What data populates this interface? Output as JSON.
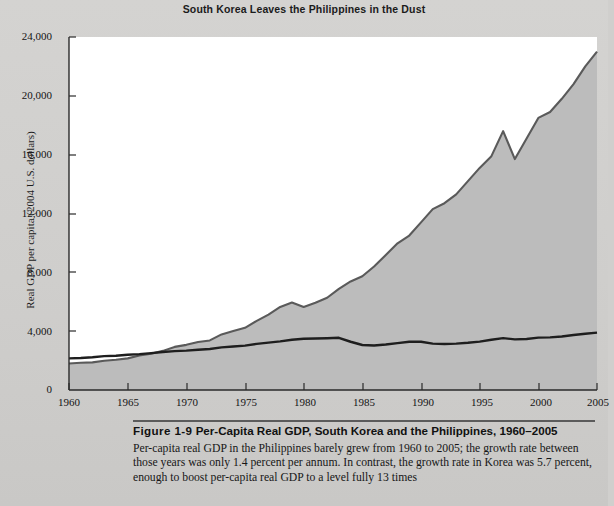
{
  "chart_data": {
    "type": "area",
    "title": "South Korea Leaves the Philippines in the Dust",
    "xlabel": "",
    "ylabel": "Real GDP per capita (2004 U.S. dollars)",
    "xlim": [
      1960,
      2005
    ],
    "ylim": [
      0,
      24000
    ],
    "grid": false,
    "legend_position": "inline-annotations",
    "x_ticks": [
      "1960",
      "1965",
      "1970",
      "1975",
      "1980",
      "1985",
      "1990",
      "1995",
      "2000",
      "2005"
    ],
    "y_ticks": [
      "0",
      "4,000",
      "8,000",
      "12,000",
      "16,000",
      "20,000",
      "24,000"
    ],
    "annotations": [
      {
        "text": "South Korea",
        "x": 1989,
        "y": 13900
      },
      {
        "text": "Philippines",
        "x": 1992,
        "y": 5200
      }
    ],
    "x": [
      1960,
      1961,
      1962,
      1963,
      1964,
      1965,
      1966,
      1967,
      1968,
      1969,
      1970,
      1971,
      1972,
      1973,
      1974,
      1975,
      1976,
      1977,
      1978,
      1979,
      1980,
      1981,
      1982,
      1983,
      1984,
      1985,
      1986,
      1987,
      1988,
      1989,
      1990,
      1991,
      1992,
      1993,
      1994,
      1995,
      1996,
      1997,
      1998,
      1999,
      2000,
      2001,
      2002,
      2003,
      2004,
      2005
    ],
    "series": [
      {
        "name": "South Korea",
        "fill": "#bcbcbc",
        "line": "#5a5a5a",
        "values": [
          1800,
          1850,
          1880,
          1990,
          2060,
          2150,
          2340,
          2460,
          2660,
          2930,
          3070,
          3260,
          3370,
          3780,
          4010,
          4230,
          4700,
          5130,
          5650,
          5950,
          5640,
          5930,
          6270,
          6880,
          7380,
          7730,
          8400,
          9180,
          9970,
          10500,
          11400,
          12300,
          12700,
          13300,
          14200,
          15100,
          15900,
          17600,
          15700,
          17100,
          18500,
          18900,
          19800,
          20800,
          22000,
          23000
        ]
      },
      {
        "name": "Philippines",
        "fill": "none",
        "line": "#1e1e1e",
        "values": [
          2150,
          2180,
          2230,
          2300,
          2330,
          2400,
          2440,
          2510,
          2580,
          2640,
          2680,
          2740,
          2790,
          2900,
          2960,
          3020,
          3140,
          3220,
          3310,
          3420,
          3480,
          3500,
          3520,
          3550,
          3280,
          3060,
          3030,
          3090,
          3190,
          3280,
          3280,
          3150,
          3130,
          3150,
          3210,
          3290,
          3420,
          3530,
          3440,
          3470,
          3560,
          3580,
          3640,
          3740,
          3820,
          3900
        ]
      }
    ]
  },
  "caption": {
    "figure_number": "Figure 1-9",
    "heading": "Per-Capita Real GDP, South Korea and the Philippines, 1960–2005",
    "body": "Per-capita real GDP in the Philippines barely grew from 1960 to 2005; the growth rate between those years was only 1.4 percent per annum. In contrast, the growth rate in Korea was 5.7 percent, enough to boost per-capita real GDP to a level fully 13 times"
  }
}
